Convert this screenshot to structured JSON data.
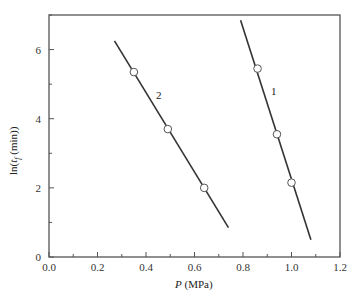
{
  "chart_data": {
    "type": "line",
    "title": "",
    "xlabel": "P (MPa)",
    "xlabel_italic_part": "P",
    "xlabel_rest": " (MPa)",
    "ylabel": "ln(t_f (min))",
    "xlim": [
      0.0,
      1.2
    ],
    "ylim": [
      0,
      7
    ],
    "grid": false,
    "legend": "none (inline series labels)",
    "x_ticks": [
      "0.0",
      "0.2",
      "0.4",
      "0.6",
      "0.8",
      "1.0",
      "1.2"
    ],
    "y_ticks": [
      "0",
      "2",
      "4",
      "6"
    ],
    "series": [
      {
        "name": "1",
        "points": [
          {
            "x": 0.86,
            "y": 5.45
          },
          {
            "x": 0.94,
            "y": 3.55
          },
          {
            "x": 1.0,
            "y": 2.15
          }
        ],
        "fit_line": [
          {
            "x": 0.79,
            "y": 6.85
          },
          {
            "x": 1.08,
            "y": 0.5
          }
        ]
      },
      {
        "name": "2",
        "points": [
          {
            "x": 0.35,
            "y": 5.35
          },
          {
            "x": 0.49,
            "y": 3.7
          },
          {
            "x": 0.64,
            "y": 2.0
          }
        ],
        "fit_line": [
          {
            "x": 0.27,
            "y": 6.25
          },
          {
            "x": 0.74,
            "y": 0.85
          }
        ]
      }
    ]
  },
  "labels": {
    "series1": "1",
    "series2": "2",
    "ylabel_prefix": "ln(",
    "ylabel_t": "t",
    "ylabel_sub": "f",
    "ylabel_suffix": " (min))",
    "xlabel_P": "P",
    "xlabel_unit": " (MPa)"
  },
  "colors": {
    "axis": "#555555",
    "line": "#333333",
    "marker_fill": "#ffffff",
    "marker_stroke": "#555555"
  }
}
